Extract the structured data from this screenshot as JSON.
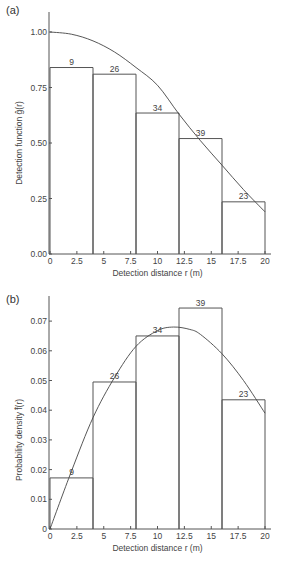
{
  "chart_data": [
    {
      "panel": "(a)",
      "type": "bar",
      "title": "",
      "xlabel": "Detection distance r (m)",
      "ylabel": "Detection function ĝ(r)",
      "xlim": [
        0,
        20
      ],
      "ylim": [
        0,
        1.0
      ],
      "x_ticks": [
        "0",
        "2.5",
        "5",
        "7.5",
        "10",
        "12.5",
        "15",
        "17.5",
        "20"
      ],
      "y_ticks": [
        "0.00",
        "0.25",
        "0.50",
        "0.75",
        "1.00"
      ],
      "grid": false,
      "bins": [
        [
          0,
          4
        ],
        [
          4,
          8
        ],
        [
          8,
          12
        ],
        [
          12,
          16
        ],
        [
          16,
          20
        ]
      ],
      "values": [
        0.84,
        0.81,
        0.635,
        0.52,
        0.235
      ],
      "counts": [
        "9",
        "26",
        "34",
        "39",
        "23"
      ],
      "curve": {
        "name": "fitted detection function",
        "x": [
          0,
          2,
          4,
          6,
          8,
          10,
          12,
          14,
          16,
          18,
          20
        ],
        "y": [
          1.0,
          0.99,
          0.96,
          0.91,
          0.84,
          0.76,
          0.63,
          0.51,
          0.4,
          0.29,
          0.19
        ]
      }
    },
    {
      "panel": "(b)",
      "type": "bar",
      "title": "",
      "xlabel": "Detection distance r (m)",
      "ylabel": "Probability density f̂(r)",
      "xlim": [
        0,
        20
      ],
      "ylim": [
        0,
        0.077
      ],
      "x_ticks": [
        "0",
        "2.5",
        "5",
        "7.5",
        "10",
        "12.5",
        "15",
        "17.5",
        "20"
      ],
      "y_ticks": [
        "0",
        "0.01",
        "0.02",
        "0.03",
        "0.04",
        "0.05",
        "0.06",
        "0.07"
      ],
      "grid": false,
      "bins": [
        [
          0,
          4
        ],
        [
          4,
          8
        ],
        [
          8,
          12
        ],
        [
          12,
          16
        ],
        [
          16,
          20
        ]
      ],
      "values": [
        0.0172,
        0.0495,
        0.065,
        0.0744,
        0.0435
      ],
      "counts": [
        "9",
        "26",
        "34",
        "39",
        "23"
      ],
      "curve": {
        "name": "fitted probability density",
        "x": [
          0,
          2,
          4,
          6,
          8,
          10,
          11.5,
          13,
          14,
          16,
          18,
          20
        ],
        "y": [
          0.0,
          0.0195,
          0.0375,
          0.051,
          0.0615,
          0.0668,
          0.068,
          0.0672,
          0.0655,
          0.059,
          0.05,
          0.039
        ]
      }
    }
  ]
}
